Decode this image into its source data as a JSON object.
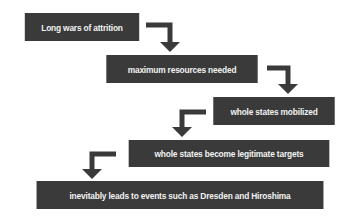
{
  "diagram": {
    "type": "flowchart",
    "colors": {
      "box": "#3a3a3a",
      "text": "#f2f2f2",
      "arrow": "#3a3a3a",
      "background": "#ffffff"
    },
    "steps": [
      {
        "label": "Long wars of attrition"
      },
      {
        "label": "maximum resources needed"
      },
      {
        "label": "whole states mobilized"
      },
      {
        "label": "whole states become legitimate targets"
      },
      {
        "label": "inevitably leads to events such as Dresden and Hiroshima"
      }
    ]
  }
}
